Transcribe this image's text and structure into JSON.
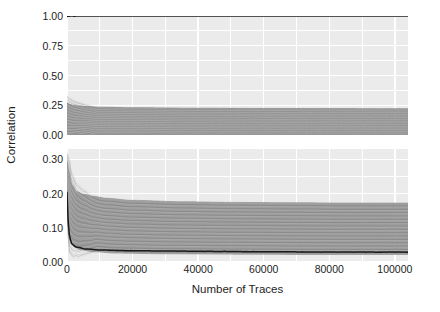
{
  "chart_data": {
    "type": "line",
    "title": "",
    "xlabel": "Number of Traces",
    "ylabel": "Correlation",
    "grid": true,
    "legend": null,
    "panels": [
      {
        "name": "top-panel",
        "ylim": [
          0.0,
          1.0
        ],
        "yticks": [
          0.0,
          0.25,
          0.5,
          0.75,
          1.0
        ],
        "ytick_labels": [
          "0.00",
          "0.25",
          "0.50",
          "0.75",
          "1.00"
        ],
        "series": [
          {
            "name": "correct-key-candidate",
            "color": "#1a1a1a",
            "style": "solid",
            "x": [
              0,
              500,
              1000,
              2000,
              5000,
              10000,
              20000,
              40000,
              60000,
              80000,
              100000
            ],
            "values": [
              0.995,
              0.998,
              0.999,
              0.999,
              1.0,
              1.0,
              1.0,
              1.0,
              1.0,
              1.0,
              1.0
            ]
          },
          {
            "name": "wrong-key-candidates-upper-envelope",
            "color": "#7a7a7a",
            "style": "solid",
            "x": [
              0,
              500,
              1000,
              2000,
              4000,
              6000,
              10000,
              20000,
              40000,
              60000,
              80000,
              100000
            ],
            "values": [
              0.27,
              0.262,
              0.255,
              0.248,
              0.243,
              0.239,
              0.234,
              0.229,
              0.225,
              0.223,
              0.222,
              0.221
            ]
          },
          {
            "name": "wrong-key-candidates-lower-envelope",
            "color": "#7a7a7a",
            "style": "solid",
            "x": [
              0,
              500,
              1000,
              2000,
              5000,
              10000,
              20000,
              40000,
              60000,
              80000,
              100000
            ],
            "values": [
              0.012,
              0.008,
              0.006,
              0.005,
              0.004,
              0.003,
              0.003,
              0.002,
              0.002,
              0.002,
              0.002
            ]
          }
        ]
      },
      {
        "name": "bottom-panel",
        "ylim": [
          0.0,
          0.33
        ],
        "yticks": [
          0.0,
          0.1,
          0.2,
          0.3
        ],
        "ytick_labels": [
          "0.00",
          "0.10",
          "0.20",
          "0.30"
        ],
        "series": [
          {
            "name": "highlighted-key-candidate",
            "color": "#1a1a1a",
            "style": "solid",
            "x": [
              0,
              400,
              800,
              1500,
              3000,
              6000,
              10000,
              20000,
              30000,
              45000,
              60000,
              80000,
              100000
            ],
            "values": [
              0.205,
              0.118,
              0.072,
              0.052,
              0.043,
              0.038,
              0.035,
              0.033,
              0.032,
              0.031,
              0.03,
              0.029,
              0.029
            ]
          },
          {
            "name": "wrong-key-candidates-upper-envelope",
            "color": "#8a8a8a",
            "style": "solid",
            "x": [
              0,
              600,
              1500,
              3000,
              5000,
              8000,
              12000,
              20000,
              35000,
              50000,
              70000,
              85000,
              100000
            ],
            "values": [
              0.295,
              0.262,
              0.225,
              0.205,
              0.198,
              0.192,
              0.186,
              0.18,
              0.176,
              0.174,
              0.173,
              0.172,
              0.172
            ]
          },
          {
            "name": "wrong-key-candidates-median-band",
            "color": "#9b9b9b",
            "style": "solid",
            "x": [
              0,
              600,
              1500,
              3000,
              6000,
              12000,
              25000,
              45000,
              70000,
              100000
            ],
            "values": [
              0.24,
              0.185,
              0.152,
              0.136,
              0.126,
              0.119,
              0.114,
              0.111,
              0.11,
              0.109
            ]
          },
          {
            "name": "wrong-key-candidates-lower-envelope",
            "color": "#8a8a8a",
            "style": "solid",
            "x": [
              0,
              400,
              900,
              2000,
              4000,
              8000,
              15000,
              30000,
              50000,
              75000,
              100000
            ],
            "values": [
              0.19,
              0.105,
              0.062,
              0.045,
              0.036,
              0.03,
              0.026,
              0.024,
              0.023,
              0.022,
              0.022
            ]
          }
        ]
      }
    ],
    "x": {
      "xlim": [
        0,
        104000
      ],
      "ticks": [
        0,
        20000,
        40000,
        60000,
        80000,
        100000
      ],
      "tick_labels": [
        "0",
        "20000",
        "40000",
        "60000",
        "80000",
        "100000"
      ]
    },
    "colors": {
      "panel_background": "#ebebeb",
      "grid_line": "#ffffff",
      "highlight_curve": "#1a1a1a",
      "bundle_curve": "#8f8f8f",
      "text": "#1d1d1d",
      "figure_background": "#ffffff"
    }
  }
}
